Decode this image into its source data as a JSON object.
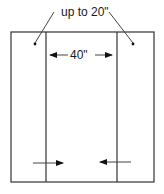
{
  "diagram": {
    "top_label": "up to 20\"",
    "width_label": "40\"",
    "colors": {
      "stroke": "#333333",
      "text": "#1a1a1a",
      "background": "#ffffff"
    }
  }
}
